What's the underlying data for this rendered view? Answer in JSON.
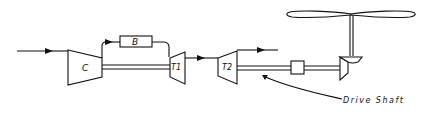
{
  "diagram": {
    "title": "",
    "type": "turboshaft engine schematic",
    "components": {
      "compressor": {
        "label": "C"
      },
      "combustor": {
        "label": "B"
      },
      "gas_generator_turbine": {
        "label": "T1"
      },
      "power_turbine": {
        "label": "T2"
      },
      "coupling": {
        "label": ""
      },
      "gearbox": {
        "label": ""
      },
      "rotor": {
        "label": ""
      }
    },
    "annotations": {
      "drive_shaft": "Drive Shaft"
    },
    "flows": [
      {
        "from": "inlet",
        "to": "C"
      },
      {
        "from": "C",
        "to": "B"
      },
      {
        "from": "B",
        "to": "T1"
      },
      {
        "from": "T1",
        "to": "T2"
      },
      {
        "from": "T2",
        "to": "exhaust"
      }
    ],
    "colors": {
      "line": "#111111",
      "background": "#ffffff"
    }
  }
}
